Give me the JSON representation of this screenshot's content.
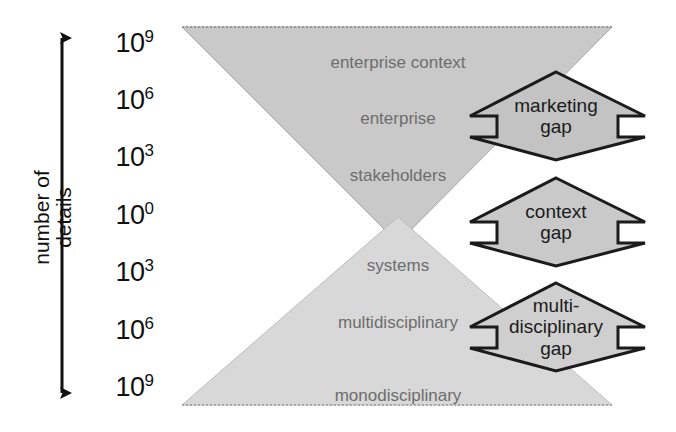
{
  "diagram": {
    "axis": {
      "title": "number of\ndetails",
      "arrow_name": "double-headed-vertical-arrow",
      "ticks": [
        {
          "base": "10",
          "exponent": "9",
          "y": 42
        },
        {
          "base": "10",
          "exponent": "6",
          "y": 99
        },
        {
          "base": "10",
          "exponent": "3",
          "y": 156
        },
        {
          "base": "10",
          "exponent": "0",
          "y": 214
        },
        {
          "base": "10",
          "exponent": "3",
          "y": 271
        },
        {
          "base": "10",
          "exponent": "6",
          "y": 329
        },
        {
          "base": "10",
          "exponent": "9",
          "y": 386
        }
      ]
    },
    "upper_triangle": {
      "name": "context-triangle",
      "fill": "#c9c9c9",
      "labels": [
        {
          "text": "enterprise context",
          "x": 398,
          "y": 62
        },
        {
          "text": "enterprise",
          "x": 398,
          "y": 118
        },
        {
          "text": "stakeholders",
          "x": 398,
          "y": 175
        }
      ]
    },
    "lower_triangle": {
      "name": "discipline-triangle",
      "fill": "#d8d8d8",
      "labels": [
        {
          "text": "systems",
          "x": 398,
          "y": 265
        },
        {
          "text": "multidisciplinary",
          "x": 398,
          "y": 322
        },
        {
          "text": "monodisciplinary",
          "x": 398,
          "y": 395
        }
      ]
    },
    "gaps": [
      {
        "name": "marketing-gap",
        "text": "marketing\ngap",
        "cx": 556,
        "cy": 116,
        "fill": "#c3c3c3",
        "stroke": "#1b1b1b"
      },
      {
        "name": "context-gap",
        "text": "context\ngap",
        "cx": 556,
        "cy": 222,
        "fill": "#c9c9c9",
        "stroke": "#1b1b1b"
      },
      {
        "name": "multidisciplinary-gap",
        "text": "multi-\ndisciplinary\ngap",
        "cx": 556,
        "cy": 327,
        "fill": "#cfcfcf",
        "stroke": "#1b1b1b"
      }
    ]
  },
  "colors": {
    "background": "#ffffff",
    "ink": "#111111",
    "triangle_label": "#6d6d6d",
    "gap_stroke": "#1b1b1b"
  }
}
